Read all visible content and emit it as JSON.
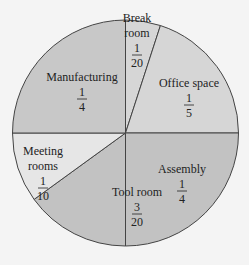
{
  "chart_data": {
    "type": "pie",
    "title": "",
    "slices": [
      {
        "label": "Break room",
        "line1": "Break",
        "line2": "room",
        "num": "1",
        "den": "20",
        "value": 0.05,
        "color": "#d6d6d6"
      },
      {
        "label": "Office space",
        "line1": "Office space",
        "line2": "",
        "num": "1",
        "den": "5",
        "value": 0.2,
        "color": "#d6d6d6"
      },
      {
        "label": "Assembly",
        "line1": "Assembly",
        "line2": "",
        "num": "1",
        "den": "4",
        "value": 0.25,
        "color": "#c2c2c2"
      },
      {
        "label": "Tool room",
        "line1": "Tool room",
        "line2": "",
        "num": "3",
        "den": "20",
        "value": 0.15,
        "color": "#c2c2c2"
      },
      {
        "label": "Meeting rooms",
        "line1": "Meeting",
        "line2": "rooms",
        "num": "1",
        "den": "10",
        "value": 0.1,
        "color": "#e6e6e6"
      },
      {
        "label": "Manufacturing",
        "line1": "Manufacturing",
        "line2": "",
        "num": "1",
        "den": "4",
        "value": 0.25,
        "color": "#c8c8c8"
      }
    ]
  }
}
